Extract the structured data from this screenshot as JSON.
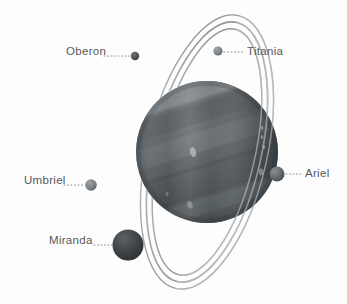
{
  "diagram": {
    "background_color": "#fdfdfd",
    "label_color": "#58585a",
    "planet": {
      "name": "Uranus",
      "center_x": 207,
      "center_y": 152,
      "radius": 71,
      "body_color": "#5a5f63",
      "highlight_color": "#7e8488",
      "shadow_color": "#33383c",
      "band_colors": [
        "#6a7074",
        "#595e62",
        "#4d5357",
        "#646a6e",
        "#41464a"
      ],
      "spots": [
        {
          "x": 193,
          "y": 152,
          "rx": 3.0,
          "ry": 5.0,
          "color": "#b4b9bc"
        },
        {
          "x": 262,
          "y": 128,
          "rx": 1.3,
          "ry": 2.0,
          "color": "#9aa0a3"
        },
        {
          "x": 262,
          "y": 137,
          "rx": 1.3,
          "ry": 2.0,
          "color": "#9aa0a3"
        },
        {
          "x": 264,
          "y": 147,
          "rx": 1.3,
          "ry": 2.0,
          "color": "#9aa0a3"
        },
        {
          "x": 261,
          "y": 172,
          "rx": 2.2,
          "ry": 3.4,
          "color": "#8d9396"
        },
        {
          "x": 190,
          "y": 205,
          "rx": 2.6,
          "ry": 3.8,
          "color": "#9aa0a3"
        },
        {
          "x": 167,
          "y": 194,
          "rx": 1.6,
          "ry": 2.4,
          "color": "#848a8d"
        }
      ]
    },
    "rings": {
      "count": 3,
      "color": "#9ea4a8",
      "tilt_degrees": 13,
      "arcs": [
        {
          "rx": 48,
          "ry": 126,
          "stroke_width": 1.5
        },
        {
          "rx": 54,
          "ry": 133,
          "stroke_width": 1.6
        },
        {
          "rx": 60,
          "ry": 140,
          "stroke_width": 1.4
        }
      ]
    },
    "moons": [
      {
        "name": "Oberon",
        "label": "Oberon",
        "label_x": 66,
        "label_y": 46,
        "dot_x": 135,
        "dot_y": 56,
        "dot_radius": 4.2,
        "color": "#4b4f53",
        "leader_from_x": 104,
        "leader_to_x": 130,
        "leader_y": 56
      },
      {
        "name": "Titania",
        "label": "Titania",
        "label_x": 247,
        "label_y": 46,
        "dot_x": 218,
        "dot_y": 51,
        "dot_radius": 4.6,
        "color": "#7d8286",
        "leader_from_x": 224,
        "leader_to_x": 244,
        "leader_y": 52
      },
      {
        "name": "Ariel",
        "label": "Ariel",
        "label_x": 305,
        "label_y": 168,
        "dot_x": 277,
        "dot_y": 174,
        "dot_radius": 7.5,
        "color": "#63686c",
        "leader_from_x": 286,
        "leader_to_x": 302,
        "leader_y": 174
      },
      {
        "name": "Umbriel",
        "label": "Umbriel",
        "label_x": 24,
        "label_y": 175,
        "dot_x": 91,
        "dot_y": 185,
        "dot_radius": 5.8,
        "color": "#7a7f83",
        "leader_from_x": 64,
        "leader_to_x": 84,
        "leader_y": 185
      },
      {
        "name": "Miranda",
        "label": "Miranda",
        "label_x": 49,
        "label_y": 235,
        "dot_x": 128,
        "dot_y": 245,
        "dot_radius": 15.5,
        "color": "#3b4044",
        "leader_from_x": 94,
        "leader_to_x": 112,
        "leader_y": 245
      }
    ]
  }
}
